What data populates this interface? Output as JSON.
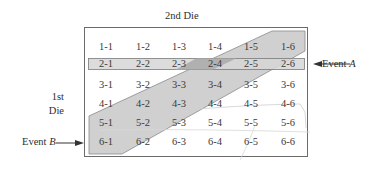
{
  "diagram": {
    "title": "2nd Die",
    "row_axis_label_line1": "1st",
    "row_axis_label_line2": "Die",
    "event_a": {
      "prefix": "Event ",
      "name": "A"
    },
    "event_b": {
      "prefix": "Event ",
      "name": "B"
    },
    "grid": [
      [
        "1-1",
        "1-2",
        "1-3",
        "1-4",
        "1-5",
        "1-6"
      ],
      [
        "2-1",
        "2-2",
        "2-3",
        "2-4",
        "2-5",
        "2-6"
      ],
      [
        "3-1",
        "3-2",
        "3-3",
        "3-4",
        "3-5",
        "3-6"
      ],
      [
        "4-1",
        "4-2",
        "4-3",
        "4-4",
        "4-5",
        "4-6"
      ],
      [
        "5-1",
        "5-2",
        "5-3",
        "5-4",
        "5-5",
        "5-6"
      ],
      [
        "6-1",
        "6-2",
        "6-3",
        "6-4",
        "6-5",
        "6-6"
      ]
    ],
    "colors": {
      "band_fill": "#c9c9c9",
      "band_overlap": "#a9a9a9",
      "border": "#6b6b6b",
      "text": "#333333"
    }
  }
}
